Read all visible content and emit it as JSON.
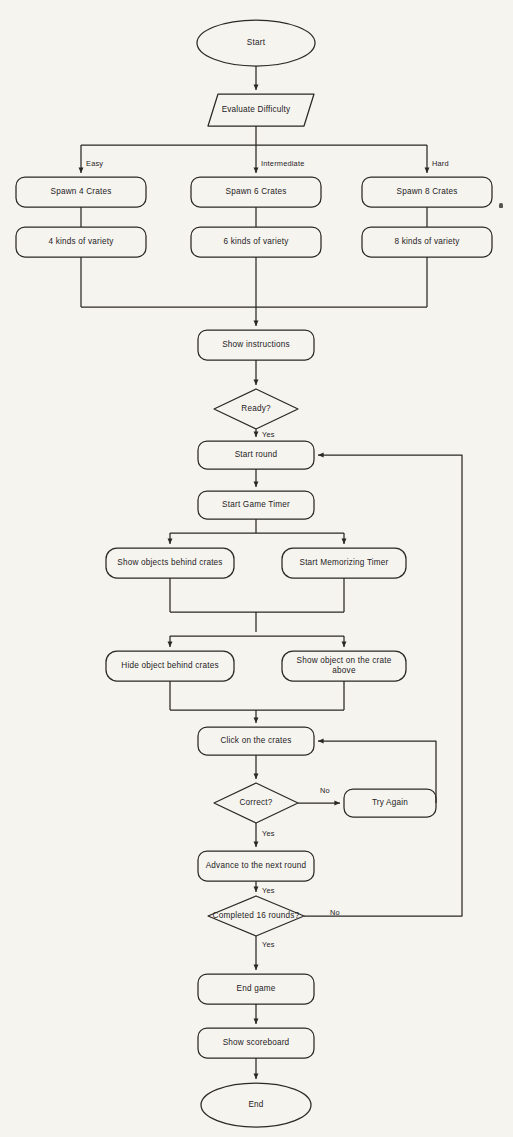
{
  "diagram": {
    "background_color": "#f6f4ee",
    "stroke_color": "#2b2926",
    "text_color": "#25221f",
    "nodes": [
      {
        "id": "start",
        "label": "Start",
        "shape": "oval",
        "x": 256,
        "y": 43,
        "w": 118,
        "h": 46
      },
      {
        "id": "evaluate",
        "label": "Evaluate Difficulty",
        "shape": "parallelogram",
        "x": 256,
        "y": 110,
        "w": 112,
        "h": 32
      },
      {
        "id": "spawn4",
        "label": "Spawn 4 Crates",
        "shape": "rounded-rect",
        "x": 81,
        "y": 192,
        "w": 130,
        "h": 30
      },
      {
        "id": "spawn6",
        "label": "Spawn 6 Crates",
        "shape": "rounded-rect",
        "x": 256,
        "y": 192,
        "w": 130,
        "h": 30
      },
      {
        "id": "spawn8",
        "label": "Spawn 8 Crates",
        "shape": "rounded-rect",
        "x": 427,
        "y": 192,
        "w": 130,
        "h": 30
      },
      {
        "id": "variety4",
        "label": "4 kinds of variety",
        "shape": "rounded-rect",
        "x": 81,
        "y": 242,
        "w": 130,
        "h": 30
      },
      {
        "id": "variety6",
        "label": "6 kinds of variety",
        "shape": "rounded-rect",
        "x": 256,
        "y": 242,
        "w": 130,
        "h": 30
      },
      {
        "id": "variety8",
        "label": "8 kinds of variety",
        "shape": "rounded-rect",
        "x": 427,
        "y": 242,
        "w": 130,
        "h": 30
      },
      {
        "id": "instructions",
        "label": "Show instructions",
        "shape": "rounded-rect",
        "x": 256,
        "y": 345,
        "w": 116,
        "h": 30
      },
      {
        "id": "ready",
        "label": "Ready?",
        "shape": "diamond",
        "x": 256,
        "y": 409,
        "w": 84,
        "h": 40
      },
      {
        "id": "startround",
        "label": "Start round",
        "shape": "rounded-rect",
        "x": 256,
        "y": 455,
        "w": 116,
        "h": 28
      },
      {
        "id": "gametimer",
        "label": "Start Game Timer",
        "shape": "rounded-rect",
        "x": 256,
        "y": 505,
        "w": 116,
        "h": 28
      },
      {
        "id": "showobjects",
        "label": "Show objects behind crates",
        "shape": "rounded-rect",
        "x": 170,
        "y": 563,
        "w": 128,
        "h": 30
      },
      {
        "id": "memtimer",
        "label": "Start Memorizing Timer",
        "shape": "rounded-rect",
        "x": 344,
        "y": 563,
        "w": 124,
        "h": 30
      },
      {
        "id": "hideobject",
        "label": "Hide object behind crates",
        "shape": "rounded-rect",
        "x": 170,
        "y": 666,
        "w": 128,
        "h": 30
      },
      {
        "id": "showcrate",
        "label": "Show object on the crate above",
        "shape": "rounded-rect",
        "x": 344,
        "y": 666,
        "w": 124,
        "h": 30
      },
      {
        "id": "click",
        "label": "Click on the crates",
        "shape": "rounded-rect",
        "x": 256,
        "y": 741,
        "w": 116,
        "h": 28
      },
      {
        "id": "correct",
        "label": "Correct?",
        "shape": "diamond",
        "x": 256,
        "y": 803,
        "w": 84,
        "h": 40
      },
      {
        "id": "tryagain",
        "label": "Try Again",
        "shape": "rounded-rect",
        "x": 390,
        "y": 803,
        "w": 92,
        "h": 28
      },
      {
        "id": "advance",
        "label": "Advance to the next round",
        "shape": "rounded-rect",
        "x": 256,
        "y": 866,
        "w": 116,
        "h": 30
      },
      {
        "id": "completed",
        "label": "Completed 16 rounds?",
        "shape": "diamond",
        "x": 256,
        "y": 916,
        "w": 96,
        "h": 40
      },
      {
        "id": "endgame",
        "label": "End game",
        "shape": "rounded-rect",
        "x": 256,
        "y": 989,
        "w": 116,
        "h": 30
      },
      {
        "id": "scoreboard",
        "label": "Show scoreboard",
        "shape": "rounded-rect",
        "x": 256,
        "y": 1043,
        "w": 116,
        "h": 30
      },
      {
        "id": "end",
        "label": "End",
        "shape": "oval",
        "x": 256,
        "y": 1105,
        "w": 110,
        "h": 44
      }
    ],
    "edge_labels": [
      {
        "id": "easy",
        "text": "Easy",
        "x": 86,
        "y": 163
      },
      {
        "id": "intermediate",
        "text": "Intermediate",
        "x": 261,
        "y": 163
      },
      {
        "id": "hard",
        "text": "Hard",
        "x": 432,
        "y": 163
      },
      {
        "id": "ready-yes",
        "text": "Yes",
        "x": 268,
        "y": 437
      },
      {
        "id": "correct-no",
        "text": "No",
        "x": 327,
        "y": 791
      },
      {
        "id": "correct-yes",
        "text": "Yes",
        "x": 268,
        "y": 836
      },
      {
        "id": "advance-yes",
        "text": "Yes",
        "x": 268,
        "y": 893
      },
      {
        "id": "completed-no",
        "text": "No",
        "x": 333,
        "y": 905
      }
    ]
  }
}
